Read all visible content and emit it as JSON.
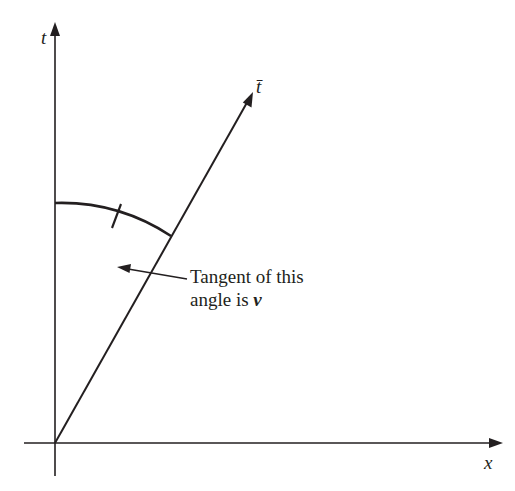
{
  "diagram": {
    "type": "spacetime-diagram",
    "colors": {
      "ink": "#231f20",
      "background": "#ffffff"
    },
    "axes": {
      "t_axis_label": "t",
      "x_axis_label": "x",
      "t_bar_axis_label": "t̄"
    },
    "annotation": {
      "line1": "Tangent of this",
      "line2_prefix": "angle is ",
      "line2_var": "v"
    }
  }
}
